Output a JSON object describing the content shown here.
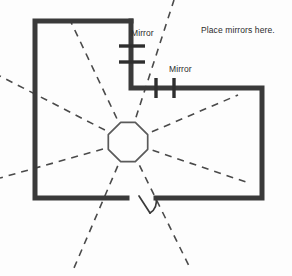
{
  "diagram": {
    "type": "floor-plan",
    "canvas": {
      "width": 292,
      "height": 276
    },
    "colors": {
      "wall": "#3a3a3a",
      "background": "#fdfdfd",
      "ray": "#4a4a4a",
      "octagon_stroke": "#5a5a5a",
      "text": "#2b2b2b"
    },
    "labels": {
      "mirror_1": "Mirror",
      "mirror_2": "Mirror",
      "instruction": "Place mirrors here."
    },
    "walls": {
      "description": "L-shaped (reverse-L) room outline drawn as thick dark segments",
      "thickness": 5,
      "segments": [
        {
          "name": "top-left-wall",
          "x1": 35,
          "y1": 21,
          "x2": 131,
          "y2": 21
        },
        {
          "name": "left-wall",
          "x1": 35,
          "y1": 21,
          "x2": 35,
          "y2": 198
        },
        {
          "name": "bottom-left-wall",
          "x1": 35,
          "y1": 198,
          "x2": 127,
          "y2": 198
        },
        {
          "name": "upper-right-vertical",
          "x1": 131,
          "y1": 21,
          "x2": 131,
          "y2": 88
        },
        {
          "name": "step-horizontal-wall",
          "x1": 131,
          "y1": 88,
          "x2": 262,
          "y2": 88
        },
        {
          "name": "right-wall",
          "x1": 262,
          "y1": 88,
          "x2": 262,
          "y2": 198
        },
        {
          "name": "bottom-right-wall",
          "x1": 262,
          "y1": 198,
          "x2": 156,
          "y2": 198
        }
      ]
    },
    "octagon": {
      "name": "central-octagon",
      "center_x": 128,
      "center_y": 142,
      "radius": 20
    },
    "rays": {
      "count": 8,
      "style": "dashed",
      "origin_x": 128,
      "origin_y": 142,
      "endpoints": [
        {
          "name": "ray-up-left",
          "x": 70,
          "y": 20
        },
        {
          "name": "ray-up-right",
          "x": 174,
          "y": 0
        },
        {
          "name": "ray-left-upper",
          "x": 0,
          "y": 76
        },
        {
          "name": "ray-right-upper",
          "x": 238,
          "y": 95
        },
        {
          "name": "ray-left-lower",
          "x": 0,
          "y": 178
        },
        {
          "name": "ray-right-lower",
          "x": 246,
          "y": 182
        },
        {
          "name": "ray-down-left",
          "x": 74,
          "y": 268
        },
        {
          "name": "ray-down-right",
          "x": 190,
          "y": 268
        }
      ]
    },
    "mirror_marks": {
      "mirror_1_ticks": [
        {
          "name": "mirror-tick-1a",
          "x1": 119,
          "y1": 46,
          "x2": 145,
          "y2": 46
        },
        {
          "name": "mirror-tick-1b",
          "x1": 119,
          "y1": 62,
          "x2": 145,
          "y2": 62
        }
      ],
      "mirror_2_ticks": [
        {
          "name": "mirror-tick-2a",
          "x1": 156,
          "y1": 78,
          "x2": 156,
          "y2": 98
        },
        {
          "name": "mirror-tick-2b",
          "x1": 174,
          "y1": 78,
          "x2": 174,
          "y2": 98
        }
      ]
    },
    "door": {
      "name": "door-opening",
      "opening_x1": 127,
      "opening_x2": 156,
      "y": 198,
      "leaf": {
        "x1": 138,
        "y1": 196,
        "x2": 150,
        "y2": 214
      },
      "arc": {
        "x1": 150,
        "y1": 214,
        "x2": 156,
        "y2": 198
      }
    }
  }
}
